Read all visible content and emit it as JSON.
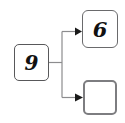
{
  "diagram": {
    "background_color": "#ffffff",
    "nodes": [
      {
        "id": "source",
        "label": "9",
        "role": "source",
        "shape": "rounded-rectangle",
        "border_color": "#58585a",
        "fill_color": "#ffffff",
        "x": 14,
        "y": 44,
        "width": 35,
        "height": 37
      },
      {
        "id": "target-top",
        "label": "6",
        "role": "target",
        "shape": "rounded-rectangle",
        "border_color": "#6a6a6c",
        "fill_color": "#ffffff",
        "x": 82,
        "y": 10,
        "width": 36,
        "height": 38
      },
      {
        "id": "target-bottom",
        "label": "",
        "role": "target",
        "shape": "rounded-rectangle",
        "border_color": "#7d7d80",
        "fill_color": "#ffffff",
        "x": 83,
        "y": 80,
        "width": 34,
        "height": 35
      }
    ],
    "connectors": {
      "style": "orthogonal-elbow",
      "line_color": "#8c8c8e",
      "arrow_color": "#1a1a1a",
      "stem_x": 62,
      "edges": [
        {
          "from": "source",
          "to": "target-top",
          "arrow": "arrowhead-right"
        },
        {
          "from": "source",
          "to": "target-bottom",
          "arrow": "arrowhead-right"
        }
      ]
    }
  }
}
